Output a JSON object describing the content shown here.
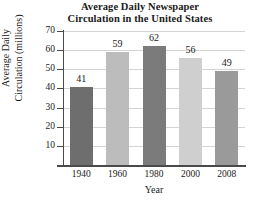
{
  "chart_data": {
    "type": "bar",
    "title": "Average Daily Newspaper Circulation in the United States",
    "title_line1": "Average Daily Newspaper",
    "title_line2": "Circulation in the United States",
    "xlabel": "Year",
    "ylabel": "Average Daily Circulation (millions)",
    "ylabel_line1": "Average Daily",
    "ylabel_line2": "Circulation (millions)",
    "categories": [
      "1940",
      "1960",
      "1980",
      "2000",
      "2008"
    ],
    "values": [
      41,
      59,
      62,
      56,
      49
    ],
    "value_labels": [
      "41",
      "59",
      "62",
      "56",
      "49"
    ],
    "ylim": [
      0,
      70
    ],
    "yticks": [
      70,
      60,
      50,
      40,
      30,
      20,
      10
    ],
    "ytick_labels": [
      "70",
      "60",
      "50",
      "40",
      "30",
      "20",
      "10"
    ],
    "grid": true,
    "legend": "none",
    "bar_colors": [
      "#6e6e6e",
      "#bcbcbc",
      "#7b7b7b",
      "#cfcfcf",
      "#9a9a9a"
    ],
    "axis_color": "#4a4a4a",
    "grid_color": "#d4d4d4",
    "background_color": "#ffffff",
    "text_color": "#1a1a1a"
  }
}
